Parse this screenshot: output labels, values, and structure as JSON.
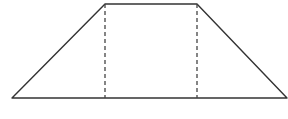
{
  "diagram": {
    "type": "geometry",
    "shape": "isosceles-trapezoid",
    "width": 288,
    "height": 119,
    "stroke_color": "#333333",
    "dashed_color": "#444444",
    "vertices": {
      "bottom_left": [
        12,
        98
      ],
      "top_left": [
        105,
        4
      ],
      "top_right": [
        197,
        4
      ],
      "bottom_right": [
        287,
        98
      ]
    },
    "heights": [
      {
        "name": "left-height",
        "x": 105,
        "y1": 4,
        "y2": 98
      },
      {
        "name": "right-height",
        "x": 197,
        "y1": 4,
        "y2": 98
      }
    ]
  }
}
